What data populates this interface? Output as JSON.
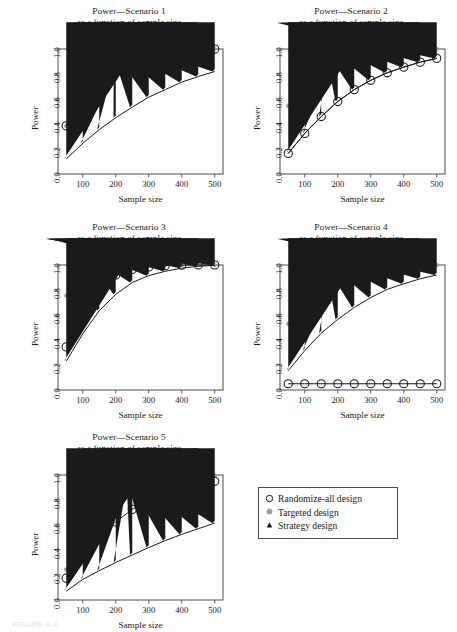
{
  "figure": {
    "caption": "FIGURE 9.4",
    "x_axis_label": "Sample size",
    "y_axis_label": "Power",
    "x_ticks": [
      "100",
      "200",
      "300",
      "400",
      "500"
    ],
    "y_ticks": [
      "0.0",
      "0.2",
      "0.4",
      "0.6",
      "0.8",
      "1.0"
    ]
  },
  "legend": {
    "position": "bottom-right",
    "items": [
      {
        "label": "Randomize-all design",
        "marker": "open-circle",
        "color": "#1a1a1a"
      },
      {
        "label": "Targeted design",
        "marker": "filled-circle",
        "color": "#9a9a9a"
      },
      {
        "label": "Strategy design",
        "marker": "filled-triangle",
        "color": "#1a1a1a"
      }
    ]
  },
  "chart_data": [
    {
      "type": "line",
      "id": "scenario-1",
      "title": "Power—Scenario 1",
      "subtitle": "as a function of sample size",
      "xlabel": "Sample size",
      "ylabel": "Power",
      "xlim": [
        25,
        525
      ],
      "ylim": [
        0.0,
        1.0
      ],
      "xticks": [
        100,
        200,
        300,
        400,
        500
      ],
      "yticks": [
        0.0,
        0.2,
        0.4,
        0.6,
        0.8,
        1.0
      ],
      "grid": false,
      "x": [
        50,
        100,
        150,
        200,
        250,
        300,
        350,
        400,
        450,
        500
      ],
      "series": [
        {
          "name": "Randomize-all design",
          "marker": "open-circle",
          "color": "#1a1a1a",
          "values": [
            0.385,
            0.705,
            0.87,
            0.95,
            0.985,
            0.997,
            1.0,
            1.0,
            1.0,
            1.0
          ]
        },
        {
          "name": "Targeted design",
          "marker": "filled-circle",
          "color": "#9a9a9a",
          "values": [
            0.385,
            0.705,
            0.87,
            0.95,
            0.985,
            0.997,
            1.0,
            1.0,
            1.0,
            1.0
          ]
        },
        {
          "name": "Strategy design",
          "marker": "filled-triangle",
          "color": "#1a1a1a",
          "values": [
            0.12,
            0.245,
            0.355,
            0.45,
            0.535,
            0.615,
            0.675,
            0.735,
            0.78,
            0.82
          ]
        }
      ]
    },
    {
      "type": "line",
      "id": "scenario-2",
      "title": "Power—Scenario 2",
      "subtitle": "as a function of sample size",
      "xlabel": "Sample size",
      "ylabel": "Power",
      "xlim": [
        25,
        525
      ],
      "ylim": [
        0.0,
        1.0
      ],
      "xticks": [
        100,
        200,
        300,
        400,
        500
      ],
      "yticks": [
        0.0,
        0.2,
        0.4,
        0.6,
        0.8,
        1.0
      ],
      "grid": false,
      "x": [
        50,
        100,
        150,
        200,
        250,
        300,
        350,
        400,
        450,
        500
      ],
      "series": [
        {
          "name": "Randomize-all design",
          "marker": "open-circle",
          "color": "#1a1a1a",
          "values": [
            0.165,
            0.325,
            0.46,
            0.58,
            0.675,
            0.75,
            0.81,
            0.855,
            0.895,
            0.925
          ]
        },
        {
          "name": "Targeted design",
          "marker": "filled-circle",
          "color": "#9a9a9a",
          "values": [
            0.545,
            0.865,
            0.965,
            0.995,
            1.0,
            1.0,
            1.0,
            1.0,
            1.0,
            1.0
          ]
        },
        {
          "name": "Strategy design",
          "marker": "filled-triangle",
          "color": "#1a1a1a",
          "values": [
            0.165,
            0.325,
            0.46,
            0.58,
            0.675,
            0.75,
            0.81,
            0.855,
            0.895,
            0.925
          ]
        }
      ]
    },
    {
      "type": "line",
      "id": "scenario-3",
      "title": "Power—Scenario 3",
      "subtitle": "as a function of sample size",
      "xlabel": "Sample size",
      "ylabel": "Power",
      "xlim": [
        25,
        525
      ],
      "ylim": [
        0.0,
        1.0
      ],
      "xticks": [
        100,
        200,
        300,
        400,
        500
      ],
      "yticks": [
        0.0,
        0.2,
        0.4,
        0.6,
        0.8,
        1.0
      ],
      "grid": false,
      "x": [
        50,
        100,
        150,
        200,
        250,
        300,
        350,
        400,
        450,
        500
      ],
      "series": [
        {
          "name": "Randomize-all design",
          "marker": "open-circle",
          "color": "#1a1a1a",
          "values": [
            0.345,
            0.645,
            0.83,
            0.92,
            0.965,
            0.985,
            0.995,
            0.999,
            1.0,
            1.0
          ]
        },
        {
          "name": "Targeted design",
          "marker": "filled-circle",
          "color": "#9a9a9a",
          "values": [
            0.755,
            0.975,
            0.997,
            1.0,
            1.0,
            1.0,
            1.0,
            1.0,
            1.0,
            1.0
          ]
        },
        {
          "name": "Strategy design",
          "marker": "filled-triangle",
          "color": "#1a1a1a",
          "values": [
            0.23,
            0.45,
            0.635,
            0.765,
            0.86,
            0.915,
            0.95,
            0.975,
            0.99,
            0.997
          ]
        }
      ]
    },
    {
      "type": "line",
      "id": "scenario-4",
      "title": "Power—Scenario 4",
      "subtitle": "as a function of sample size",
      "xlabel": "Sample size",
      "ylabel": "Power",
      "xlim": [
        25,
        525
      ],
      "ylim": [
        0.0,
        1.0
      ],
      "xticks": [
        100,
        200,
        300,
        400,
        500
      ],
      "yticks": [
        0.0,
        0.2,
        0.4,
        0.6,
        0.8,
        1.0
      ],
      "grid": false,
      "x": [
        50,
        100,
        150,
        200,
        250,
        300,
        350,
        400,
        450,
        500
      ],
      "series": [
        {
          "name": "Randomize-all design",
          "marker": "open-circle",
          "color": "#1a1a1a",
          "values": [
            0.05,
            0.05,
            0.05,
            0.05,
            0.05,
            0.05,
            0.05,
            0.05,
            0.05,
            0.05
          ]
        },
        {
          "name": "Targeted design",
          "marker": "filled-circle",
          "color": "#9a9a9a",
          "values": [
            0.53,
            0.86,
            0.965,
            0.995,
            1.0,
            1.0,
            1.0,
            1.0,
            1.0,
            1.0
          ]
        },
        {
          "name": "Strategy design",
          "marker": "filled-triangle",
          "color": "#1a1a1a",
          "values": [
            0.155,
            0.315,
            0.455,
            0.565,
            0.66,
            0.74,
            0.805,
            0.85,
            0.89,
            0.92
          ]
        }
      ]
    },
    {
      "type": "line",
      "id": "scenario-5",
      "title": "Power—Scenario 5",
      "subtitle": "as a function of sample size",
      "xlabel": "Sample size",
      "ylabel": "Power",
      "xlim": [
        25,
        525
      ],
      "ylim": [
        0.0,
        1.0
      ],
      "xticks": [
        100,
        200,
        300,
        400,
        500
      ],
      "yticks": [
        0.0,
        0.2,
        0.4,
        0.6,
        0.8,
        1.0
      ],
      "grid": false,
      "x": [
        50,
        100,
        150,
        200,
        250,
        300,
        350,
        400,
        450,
        500
      ],
      "series": [
        {
          "name": "Randomize-all design",
          "marker": "open-circle",
          "color": "#1a1a1a",
          "values": [
            0.175,
            0.355,
            0.505,
            0.625,
            0.725,
            0.8,
            0.855,
            0.895,
            0.925,
            0.95
          ]
        },
        {
          "name": "Targeted design",
          "marker": "filled-circle",
          "color": "#9a9a9a",
          "values": [
            0.245,
            0.515,
            0.7,
            0.82,
            0.89,
            0.935,
            0.96,
            0.978,
            0.99,
            0.997
          ]
        },
        {
          "name": "Strategy design",
          "marker": "filled-triangle",
          "color": "#1a1a1a",
          "values": [
            0.07,
            0.165,
            0.235,
            0.3,
            0.36,
            0.42,
            0.475,
            0.525,
            0.57,
            0.615
          ]
        }
      ]
    }
  ]
}
